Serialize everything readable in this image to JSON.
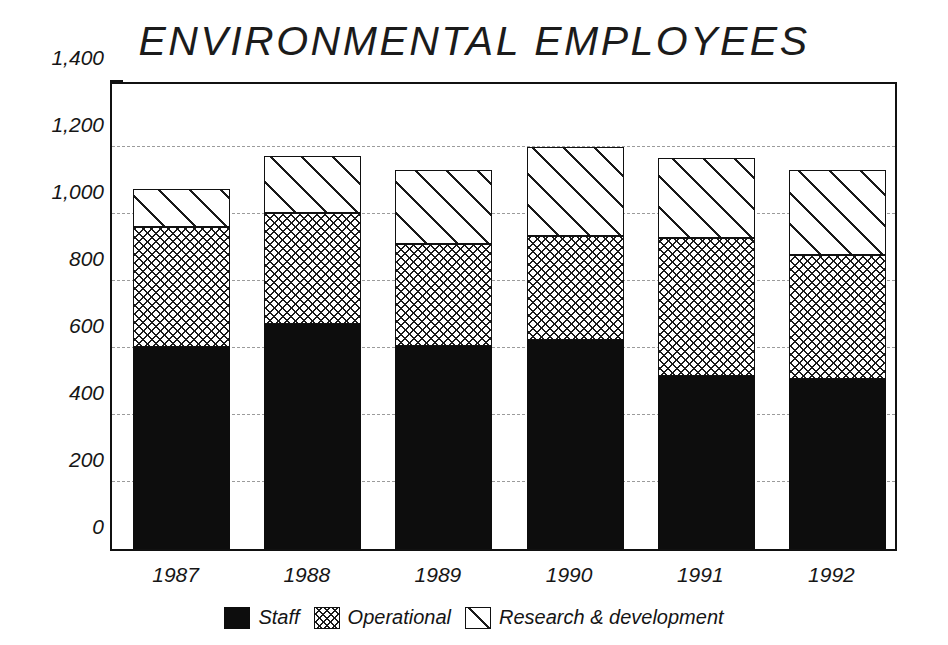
{
  "chart_data": {
    "type": "bar",
    "subtype": "stacked",
    "title": "ENVIRONMENTAL EMPLOYEES",
    "xlabel": "",
    "ylabel": "",
    "categories": [
      "1987",
      "1988",
      "1989",
      "1990",
      "1991",
      "1992"
    ],
    "series": [
      {
        "name": "Staff",
        "values": [
          603,
          672,
          607,
          624,
          516,
          507
        ]
      },
      {
        "name": "Operational",
        "values": [
          358,
          331,
          303,
          310,
          412,
          370
        ]
      },
      {
        "name": "Research & development",
        "values": [
          114,
          169,
          221,
          266,
          239,
          254
        ]
      }
    ],
    "totals": [
      1075,
      1172,
      1131,
      1200,
      1167,
      1131
    ],
    "ylim": [
      0,
      1400
    ],
    "yticks": [
      0,
      200,
      400,
      600,
      800,
      1000,
      1200,
      1400
    ],
    "ytick_labels": [
      "0",
      "200",
      "400",
      "600",
      "800",
      "1,000",
      "1,200",
      "1,400"
    ],
    "yminor_step": 100,
    "grid": true,
    "grid_style": "dashed-horizontal",
    "legend_position": "bottom",
    "colors": {
      "staff": "#0d0d0d",
      "operational": "#ffffff",
      "research_development": "#ffffff",
      "outline": "#111111",
      "grid": "#8a8a8a",
      "text": "#161616",
      "background": "#ffffff"
    },
    "patterns": {
      "staff": "solid-black",
      "operational": "crosshatch",
      "research_development": "diagonal-hatch"
    }
  },
  "legend": {
    "items": [
      {
        "label": "Staff",
        "swatch": "staff"
      },
      {
        "label": "Operational",
        "swatch": "operational"
      },
      {
        "label": "Research & development",
        "swatch": "rd"
      }
    ]
  }
}
